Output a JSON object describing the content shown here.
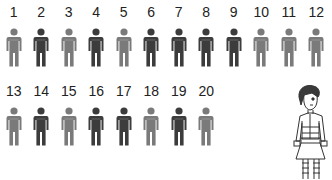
{
  "colors": {
    "light": "#7a7a7a",
    "dark": "#3c3c3c",
    "line": "#333333"
  },
  "figures": {
    "row1": [
      {
        "n": "1",
        "shade": "light"
      },
      {
        "n": "2",
        "shade": "dark"
      },
      {
        "n": "3",
        "shade": "light"
      },
      {
        "n": "4",
        "shade": "dark"
      },
      {
        "n": "5",
        "shade": "light"
      },
      {
        "n": "6",
        "shade": "dark"
      },
      {
        "n": "7",
        "shade": "dark"
      },
      {
        "n": "8",
        "shade": "dark"
      },
      {
        "n": "9",
        "shade": "dark"
      },
      {
        "n": "10",
        "shade": "light"
      },
      {
        "n": "11",
        "shade": "light"
      },
      {
        "n": "12",
        "shade": "light"
      }
    ],
    "row2": [
      {
        "n": "13",
        "shade": "light"
      },
      {
        "n": "14",
        "shade": "dark"
      },
      {
        "n": "15",
        "shade": "light"
      },
      {
        "n": "16",
        "shade": "dark"
      },
      {
        "n": "17",
        "shade": "dark"
      },
      {
        "n": "18",
        "shade": "light"
      },
      {
        "n": "19",
        "shade": "dark"
      },
      {
        "n": "20",
        "shade": "light"
      }
    ]
  },
  "illustration": {
    "icon": "girl-drawing-icon"
  }
}
